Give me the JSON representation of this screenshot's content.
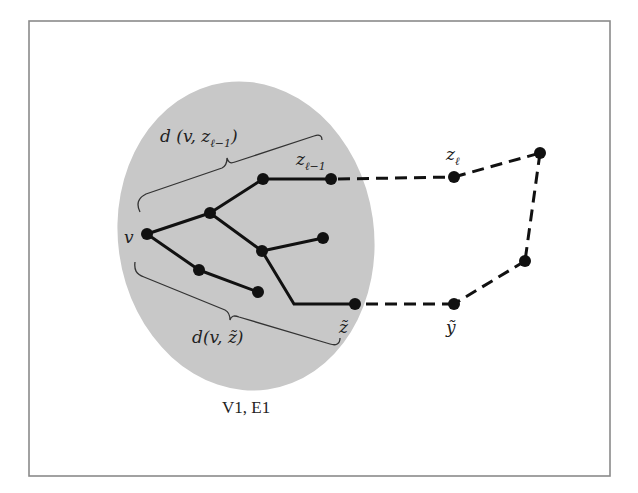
{
  "figure": {
    "region_caption": "V1, E1",
    "colors": {
      "region_fill": "#c8c8c8",
      "edge": "#111111",
      "frame": "#8a8a8a"
    },
    "labels": {
      "v": "v",
      "z_l_minus_1": {
        "base": "z",
        "sub": "ℓ−1"
      },
      "z_l": {
        "base": "z",
        "sub": "ℓ"
      },
      "z_tilde": "z̃",
      "y_tilde": "ỹ",
      "brace_top": {
        "prefix": "d (v, z",
        "sub": "ℓ−1",
        "suffix": ")"
      },
      "brace_bottom": "d(v, z̃)"
    },
    "nodes": [
      {
        "id": "v",
        "x": 147,
        "y": 234
      },
      {
        "id": "a",
        "x": 210,
        "y": 213
      },
      {
        "id": "b",
        "x": 263,
        "y": 179
      },
      {
        "id": "z_l_minus_1",
        "x": 331,
        "y": 179
      },
      {
        "id": "c",
        "x": 262,
        "y": 251
      },
      {
        "id": "d",
        "x": 323,
        "y": 238
      },
      {
        "id": "e",
        "x": 199,
        "y": 270
      },
      {
        "id": "f",
        "x": 258,
        "y": 292
      },
      {
        "id": "z_tilde",
        "x": 355,
        "y": 304
      },
      {
        "id": "z_l",
        "x": 454,
        "y": 177
      },
      {
        "id": "p",
        "x": 540,
        "y": 153
      },
      {
        "id": "q",
        "x": 525,
        "y": 261
      },
      {
        "id": "y_tilde",
        "x": 454,
        "y": 304
      }
    ],
    "solid_edges": [
      [
        "v",
        "a"
      ],
      [
        "a",
        "b"
      ],
      [
        "b",
        "z_l_minus_1"
      ],
      [
        "a",
        "c"
      ],
      [
        "c",
        "d"
      ],
      [
        "v",
        "e"
      ],
      [
        "e",
        "f"
      ],
      [
        "c",
        "bend"
      ],
      [
        "bend",
        "z_tilde"
      ]
    ],
    "dashed_edges": [
      [
        "z_l_minus_1",
        "z_l"
      ],
      [
        "z_l",
        "p"
      ],
      [
        "p",
        "q"
      ],
      [
        "q",
        "y_tilde"
      ],
      [
        "y_tilde",
        "z_tilde"
      ]
    ]
  }
}
